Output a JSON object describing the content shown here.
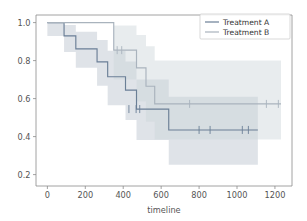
{
  "chart_data": {
    "type": "line",
    "subtype": "kaplan-meier-step",
    "title": "",
    "xlabel": "timeline",
    "ylabel": "",
    "xlim": [
      -60,
      1290
    ],
    "ylim": [
      0.14,
      1.04
    ],
    "xticks": [
      0,
      200,
      400,
      600,
      800,
      1000,
      1200
    ],
    "xticklabels": [
      "0",
      "200",
      "400",
      "600",
      "800",
      "1000",
      "1200"
    ],
    "yticks": [
      0.2,
      0.4,
      0.6,
      0.8,
      1.0
    ],
    "yticklabels": [
      "0.2",
      "0.4",
      "0.6",
      "0.8",
      "1.0"
    ],
    "grid": false,
    "legend_position": "upper right",
    "series": [
      {
        "name": "Treatment A",
        "color": "#6b7f96",
        "band_color": "#b8c2cc",
        "band_opacity": 0.45,
        "steps_x": [
          0,
          88,
          150,
          262,
          318,
          350,
          412,
          470,
          560,
          640,
          1110
        ],
        "steps_y": [
          1.0,
          0.93,
          0.862,
          0.793,
          0.715,
          0.715,
          0.645,
          0.545,
          0.545,
          0.435,
          0.435
        ],
        "ci_lower": [
          0.93,
          0.845,
          0.762,
          0.668,
          0.565,
          0.565,
          0.488,
          0.382,
          0.382,
          0.252,
          0.252
        ],
        "ci_upper": [
          1.0,
          0.988,
          0.952,
          0.908,
          0.852,
          0.852,
          0.795,
          0.7,
          0.7,
          0.61,
          0.61
        ],
        "censor_x": [
          430,
          468,
          487,
          800,
          858,
          1028,
          1060
        ],
        "censor_y": [
          0.545,
          0.545,
          0.545,
          0.435,
          0.435,
          0.435,
          0.435
        ]
      },
      {
        "name": "Treatment B",
        "color": "#a9b3bd",
        "band_color": "#cdd4da",
        "band_opacity": 0.45,
        "steps_x": [
          0,
          350,
          402,
          470,
          520,
          566,
          1232
        ],
        "steps_y": [
          1.0,
          0.855,
          0.855,
          0.762,
          0.665,
          0.572,
          0.572
        ],
        "ci_lower": [
          1.0,
          0.7,
          0.7,
          0.585,
          0.478,
          0.385,
          0.385
        ],
        "ci_upper": [
          1.0,
          0.985,
          0.985,
          0.935,
          0.875,
          0.8,
          0.8
        ],
        "censor_x": [
          368,
          392,
          750,
          1155,
          1218
        ],
        "censor_y": [
          0.855,
          0.855,
          0.572,
          0.572,
          0.572
        ]
      }
    ]
  },
  "legend": {
    "entries": [
      {
        "label": "Treatment A"
      },
      {
        "label": "Treatment B"
      }
    ]
  },
  "axes": {
    "x_title": "timeline",
    "x_tick_labels": [
      "0",
      "200",
      "400",
      "600",
      "800",
      "1000",
      "1200"
    ],
    "y_tick_labels": [
      "0.2",
      "0.4",
      "0.6",
      "0.8",
      "1.0"
    ]
  },
  "colors": {
    "background": "#ffffff",
    "spine": "#8a8a8a",
    "tick_text": "#555555",
    "series_a": "#6b7f96",
    "series_b": "#a9b3bd"
  }
}
